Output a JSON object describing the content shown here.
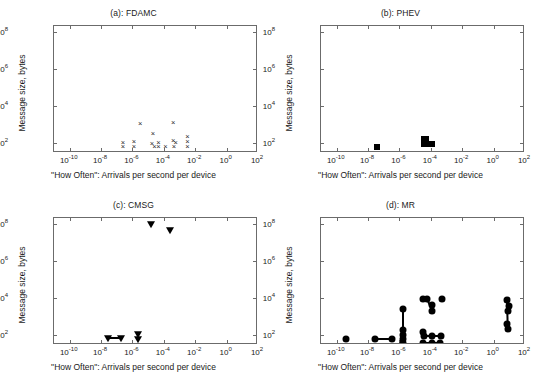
{
  "figure": {
    "width": 534,
    "height": 385,
    "background": "#ffffff"
  },
  "axis": {
    "xlabel": "\"How Often\": Arrivals per second per device",
    "ylabel": "Message size, bytes",
    "xticks": [
      {
        "mant": "10",
        "exp": "-10",
        "value": -10
      },
      {
        "mant": "10",
        "exp": "-8",
        "value": -8
      },
      {
        "mant": "10",
        "exp": "-6",
        "value": -6
      },
      {
        "mant": "10",
        "exp": "-4",
        "value": -4
      },
      {
        "mant": "10",
        "exp": "-2",
        "value": -2
      },
      {
        "mant": "10",
        "exp": "0",
        "value": 0
      },
      {
        "mant": "10",
        "exp": "2",
        "value": 2
      }
    ],
    "yticks": [
      {
        "mant": "10",
        "exp": "2",
        "value": 2
      },
      {
        "mant": "10",
        "exp": "4",
        "value": 4
      },
      {
        "mant": "10",
        "exp": "6",
        "value": 6
      },
      {
        "mant": "10",
        "exp": "8",
        "value": 8
      }
    ],
    "xlim": [
      -11,
      2
    ],
    "ylim": [
      1.45,
      8.35
    ],
    "xscale": "log10",
    "yscale": "log10",
    "grid": false,
    "box": true
  },
  "chart_data": [
    {
      "type": "scatter",
      "panel": "a",
      "title": "(a): FDAMC",
      "marker": "x",
      "marker_color": "#2a2a2a",
      "xlabel": "\"How Often\": Arrivals per second per device",
      "ylabel": "Message size, bytes",
      "xlim": [
        -11,
        2
      ],
      "ylim": [
        1.45,
        8.35
      ],
      "points": [
        {
          "x": -6.6,
          "y": 2.02
        },
        {
          "x": -6.6,
          "y": 1.78
        },
        {
          "x": -5.9,
          "y": 2.05
        },
        {
          "x": -5.9,
          "y": 1.8
        },
        {
          "x": -5.5,
          "y": 3.05
        },
        {
          "x": -4.7,
          "y": 2.48
        },
        {
          "x": -4.75,
          "y": 1.95
        },
        {
          "x": -4.6,
          "y": 1.8
        },
        {
          "x": -4.35,
          "y": 2.02
        },
        {
          "x": -4.35,
          "y": 1.8
        },
        {
          "x": -3.9,
          "y": 1.78
        },
        {
          "x": -3.4,
          "y": 3.08
        },
        {
          "x": -3.4,
          "y": 2.08
        },
        {
          "x": -3.25,
          "y": 2.02
        },
        {
          "x": -3.35,
          "y": 1.78
        },
        {
          "x": -2.5,
          "y": 2.3
        },
        {
          "x": -2.5,
          "y": 2.05
        },
        {
          "x": -2.5,
          "y": 1.78
        }
      ],
      "segments": []
    },
    {
      "type": "scatter",
      "panel": "b",
      "title": "(b): PHEV",
      "marker": "square",
      "marker_color": "#000000",
      "xlabel": "\"How Often\": Arrivals per second per device",
      "ylabel": "Message size, bytes",
      "xlim": [
        -11,
        2
      ],
      "ylim": [
        1.45,
        8.35
      ],
      "points": [
        {
          "x": -7.4,
          "y": 1.75
        },
        {
          "x": -4.45,
          "y": 2.22
        },
        {
          "x": -4.3,
          "y": 2.22
        },
        {
          "x": -4.45,
          "y": 1.95
        },
        {
          "x": -4.3,
          "y": 1.95
        },
        {
          "x": -4.1,
          "y": 1.95
        },
        {
          "x": -3.9,
          "y": 1.95
        }
      ],
      "segments": []
    },
    {
      "type": "scatter",
      "panel": "c",
      "title": "(c): CMSG",
      "marker": "triangle-down",
      "marker_color": "#000000",
      "xlabel": "\"How Often\": Arrivals per second per device",
      "ylabel": "Message size, bytes",
      "xlim": [
        -11,
        2
      ],
      "ylim": [
        1.45,
        8.35
      ],
      "points": [
        {
          "x": -7.55,
          "y": 1.82
        },
        {
          "x": -6.7,
          "y": 1.82
        },
        {
          "x": -5.65,
          "y": 2.05
        },
        {
          "x": -5.65,
          "y": 1.8
        },
        {
          "x": -4.85,
          "y": 8.0
        },
        {
          "x": -3.6,
          "y": 7.7
        }
      ],
      "segments": [
        {
          "x1": -7.55,
          "y1": 1.82,
          "x2": -6.7,
          "y2": 1.82
        }
      ]
    },
    {
      "type": "scatter",
      "panel": "d",
      "title": "(d): MR",
      "marker": "circle",
      "marker_color": "#000000",
      "xlabel": "\"How Often\": Arrivals per second per device",
      "ylabel": "Message size, bytes",
      "xlim": [
        -11,
        2
      ],
      "ylim": [
        1.45,
        8.35
      ],
      "points": [
        {
          "x": -9.4,
          "y": 1.78
        },
        {
          "x": -7.55,
          "y": 1.78
        },
        {
          "x": -6.5,
          "y": 1.78
        },
        {
          "x": -5.75,
          "y": 3.4
        },
        {
          "x": -5.75,
          "y": 2.28
        },
        {
          "x": -5.75,
          "y": 2.02
        },
        {
          "x": -5.75,
          "y": 1.8
        },
        {
          "x": -5.75,
          "y": 1.55
        },
        {
          "x": -4.5,
          "y": 3.95
        },
        {
          "x": -4.25,
          "y": 3.95
        },
        {
          "x": -3.95,
          "y": 3.6
        },
        {
          "x": -3.9,
          "y": 3.3
        },
        {
          "x": -3.3,
          "y": 3.95
        },
        {
          "x": -4.5,
          "y": 2.15
        },
        {
          "x": -4.45,
          "y": 1.95
        },
        {
          "x": -3.9,
          "y": 1.95
        },
        {
          "x": -3.35,
          "y": 1.95
        },
        {
          "x": -4.5,
          "y": 1.58
        },
        {
          "x": -3.95,
          "y": 1.58
        },
        {
          "x": -3.4,
          "y": 1.58
        },
        {
          "x": 0.85,
          "y": 3.9
        },
        {
          "x": 0.95,
          "y": 3.55
        },
        {
          "x": 0.9,
          "y": 3.3
        },
        {
          "x": 0.85,
          "y": 2.6
        },
        {
          "x": 0.9,
          "y": 2.3
        }
      ],
      "segments": [
        {
          "x1": -7.55,
          "y1": 1.78,
          "x2": -6.5,
          "y2": 1.78
        },
        {
          "x1": -5.75,
          "y1": 3.4,
          "x2": -5.75,
          "y2": 1.8
        },
        {
          "x1": -4.5,
          "y1": 3.95,
          "x2": -4.25,
          "y2": 3.95
        },
        {
          "x1": -4.25,
          "y1": 3.95,
          "x2": -3.9,
          "y2": 3.3
        },
        {
          "x1": -4.5,
          "y1": 2.15,
          "x2": -4.5,
          "y2": 1.95
        },
        {
          "x1": -4.45,
          "y1": 1.95,
          "x2": -3.35,
          "y2": 1.95
        },
        {
          "x1": -4.5,
          "y1": 1.58,
          "x2": -3.4,
          "y2": 1.58
        },
        {
          "x1": 0.85,
          "y1": 3.9,
          "x2": 0.9,
          "y2": 2.3
        }
      ]
    }
  ]
}
